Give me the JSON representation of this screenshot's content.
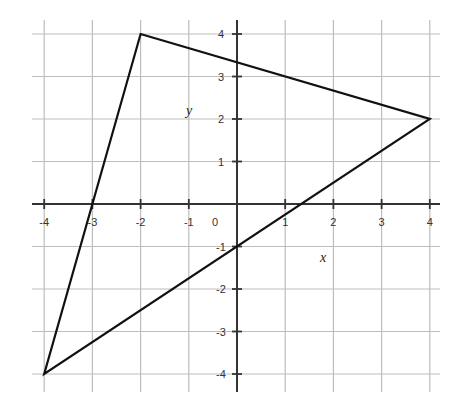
{
  "chart_data": {
    "type": "line",
    "title": "",
    "xlabel": "x",
    "ylabel": "y",
    "xlim": [
      -4,
      4
    ],
    "ylim": [
      -4,
      4
    ],
    "grid": true,
    "x_ticks": [
      -4,
      -3,
      -2,
      -1,
      0,
      1,
      2,
      3,
      4
    ],
    "y_ticks": [
      -4,
      -3,
      -2,
      -1,
      1,
      2,
      3,
      4
    ],
    "x_tick_labels": [
      "-4",
      "-3",
      "-2",
      "-1",
      "0",
      "1",
      "2",
      "3",
      "4"
    ],
    "y_tick_labels": [
      "-4",
      "-3",
      "-2",
      "-1",
      "1",
      "2",
      "3",
      "4"
    ],
    "series": [
      {
        "name": "triangle",
        "closed": true,
        "points": [
          [
            -2,
            4
          ],
          [
            4,
            2
          ],
          [
            -4,
            -4
          ]
        ]
      }
    ],
    "colors": {
      "grid": "#bdbdbd",
      "axis": "#333333",
      "line": "#111111"
    }
  }
}
